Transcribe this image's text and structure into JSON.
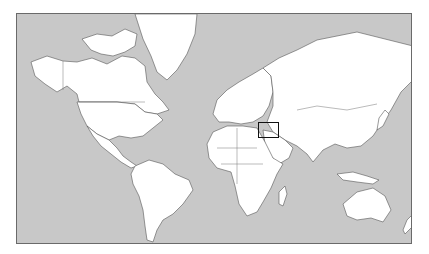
{
  "map": {
    "projection": "mercator-world",
    "colors": {
      "ocean": "#c8c8c8",
      "land": "#ffffff",
      "coast": "#555555",
      "frame": "#6a6a6a",
      "highlight": "#111111"
    },
    "highlight_region": {
      "label": "Middle East (Iraq / Persian Gulf)",
      "x": 257,
      "y": 121,
      "width": 21,
      "height": 16
    }
  }
}
